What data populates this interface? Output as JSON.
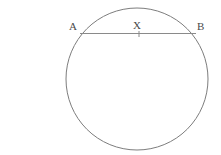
{
  "figure": {
    "background_color": "#ffffff",
    "width": 221,
    "height": 155,
    "stroke_color": "#7d7d7d",
    "chord_color": "#8a8a8a",
    "label_color": "#4a4a4a",
    "circle": {
      "name": "circle-outline",
      "center_x": 137,
      "center_y": 79,
      "radius": 71,
      "fill": "none",
      "stroke_width": 1
    },
    "chord": {
      "name": "chord-ab",
      "x1": 80,
      "y1": 33.5,
      "x2": 196,
      "y2": 33.5,
      "stroke_width": 1.2
    },
    "tick": {
      "name": "tick-mark-x",
      "x": 139,
      "y1": 31,
      "y2": 37,
      "stroke_width": 1
    },
    "labels": [
      {
        "id": "A",
        "text": "A",
        "x": 69,
        "y": 21
      },
      {
        "id": "X",
        "text": "X",
        "x": 133,
        "y": 20
      },
      {
        "id": "B",
        "text": "B",
        "x": 197,
        "y": 21
      }
    ]
  }
}
